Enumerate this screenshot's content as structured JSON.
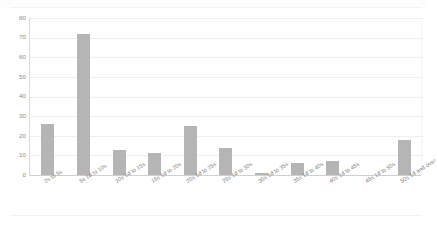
{
  "window": {
    "top_strip": {
      "ghost_left": "",
      "ghost_mid": "",
      "ghost_right": ""
    }
  },
  "chart_data": {
    "type": "bar",
    "title": "",
    "subtitle": "",
    "xlabel": "",
    "ylabel": "",
    "categories": [
      "2s to 5s",
      "5s 1d to 10s",
      "10s 1d to 15s",
      "15s 1d to 20s",
      "20s 1d to 25s",
      "25s 1d to 30s",
      "30s 1d to 35s",
      "35s 1d to 40s",
      "40s 1d to 45s",
      "45s 1d to 50s",
      "50s 1d and over"
    ],
    "values": [
      26,
      72,
      13,
      11,
      25,
      14,
      1,
      6,
      7,
      0,
      18
    ],
    "ylim": [
      0,
      80
    ],
    "yticks": [
      0,
      10,
      20,
      30,
      40,
      50,
      60,
      70,
      80
    ],
    "ytick_labels": [
      "0",
      "10",
      "20",
      "30",
      "40",
      "50",
      "60",
      "70",
      "80"
    ],
    "grid": true,
    "grid_axis": "y",
    "legend": false,
    "legend_position": "none",
    "bar_color": "#b5b5b5",
    "grid_color": "#eeeeee",
    "axis_color": "#d9d9d9",
    "tick_label_color": "#808080",
    "background": "#ffffff"
  }
}
